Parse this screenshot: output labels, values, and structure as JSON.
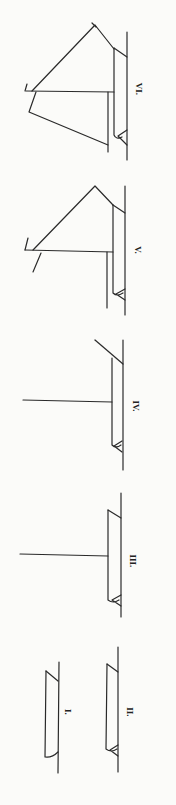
{
  "diagram": {
    "orientation": "rotated 90 degrees clockwise",
    "figures": [
      {
        "id": "fig-1",
        "label": "I.",
        "elements": [
          "hull"
        ]
      },
      {
        "id": "fig-2",
        "label": "II.",
        "elements": [
          "hull",
          "stern-post"
        ]
      },
      {
        "id": "fig-3",
        "label": "III.",
        "elements": [
          "hull",
          "stern-post",
          "mast"
        ]
      },
      {
        "id": "fig-4",
        "label": "IV.",
        "elements": [
          "hull",
          "stern-post",
          "mast",
          "bow-stay"
        ]
      },
      {
        "id": "fig-5",
        "label": "V.",
        "elements": [
          "hull",
          "stern-post",
          "mast",
          "triangular-sail",
          "gaff",
          "spar",
          "boom"
        ]
      },
      {
        "id": "fig-6",
        "label": "VI.",
        "elements": [
          "hull",
          "stern-post",
          "mast",
          "fore-sail",
          "main-sail",
          "gaff",
          "boom"
        ]
      }
    ]
  }
}
